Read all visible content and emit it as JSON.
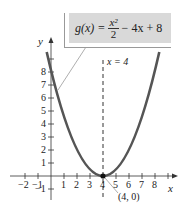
{
  "equation": {
    "lhs": "g(x) =",
    "numerator": "x²",
    "denominator": "2",
    "rhs": "− 4x + 8"
  },
  "axis_labels": {
    "x": "x",
    "y": "y"
  },
  "x_ticks": [
    "−2",
    "−1",
    "1",
    "2",
    "3",
    "4",
    "5",
    "6",
    "7",
    "8"
  ],
  "y_ticks": [
    "−1",
    "1",
    "2",
    "3",
    "4",
    "5",
    "6",
    "7",
    "8"
  ],
  "vertex_label": "(4, 0)",
  "axis_of_symmetry_label": "x = 4",
  "colors": {
    "curve": "#555555",
    "axis": "#333333",
    "box": "#d9d9d9"
  }
}
